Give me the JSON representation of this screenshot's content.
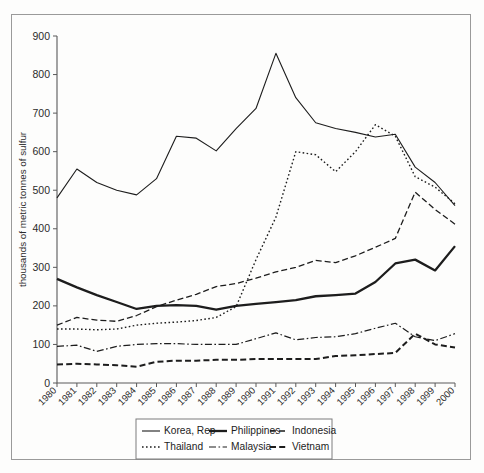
{
  "chart_data": {
    "type": "line",
    "title": "",
    "xlabel": "",
    "ylabel": "thousands of metric tonnes of sulfur",
    "xlim": [
      1980,
      2000
    ],
    "ylim": [
      0,
      900
    ],
    "yticks": [
      0,
      100,
      200,
      300,
      400,
      500,
      600,
      700,
      800,
      900
    ],
    "grid": false,
    "legend_position": "bottom",
    "x": [
      1980,
      1981,
      1982,
      1983,
      1984,
      1985,
      1986,
      1987,
      1988,
      1989,
      1990,
      1991,
      1992,
      1993,
      1994,
      1995,
      1996,
      1997,
      1998,
      1999,
      2000
    ],
    "categories": [
      "1980",
      "1981",
      "1982",
      "1983",
      "1984",
      "1985",
      "1986",
      "1987",
      "1988",
      "1989",
      "1990",
      "1991",
      "1992",
      "1993",
      "1994",
      "1995",
      "1996",
      "1997",
      "1998",
      "1999",
      "2000"
    ],
    "series": [
      {
        "name": "Korea, Rep",
        "style": "solid",
        "width": 1.1,
        "dash": "none",
        "values": [
          480,
          555,
          520,
          500,
          488,
          530,
          640,
          635,
          602,
          660,
          712,
          855,
          740,
          675,
          660,
          650,
          638,
          645,
          560,
          520,
          460
        ]
      },
      {
        "name": "Philippines",
        "style": "solid-thick",
        "width": 2.3,
        "dash": "none",
        "values": [
          270,
          248,
          228,
          210,
          192,
          200,
          202,
          200,
          190,
          200,
          205,
          210,
          215,
          225,
          228,
          232,
          262,
          310,
          320,
          292,
          355
        ]
      },
      {
        "name": "Indonesia",
        "style": "dashed",
        "width": 1.3,
        "dash": "6,3",
        "values": [
          150,
          170,
          163,
          160,
          175,
          198,
          215,
          230,
          250,
          258,
          272,
          288,
          300,
          318,
          312,
          330,
          352,
          375,
          495,
          450,
          412
        ]
      },
      {
        "name": "Thailand",
        "style": "dotted",
        "width": 1.4,
        "dash": "1.6,2.4",
        "values": [
          140,
          140,
          138,
          140,
          150,
          155,
          158,
          162,
          170,
          198,
          320,
          430,
          600,
          592,
          548,
          600,
          670,
          640,
          535,
          508,
          465
        ]
      },
      {
        "name": "Malaysia",
        "style": "dash-dot",
        "width": 1.2,
        "dash": "7,2.5,1.6,2.5",
        "values": [
          95,
          98,
          82,
          95,
          100,
          102,
          102,
          100,
          100,
          100,
          115,
          130,
          112,
          118,
          120,
          128,
          142,
          155,
          120,
          110,
          128
        ]
      },
      {
        "name": "Vietnam",
        "style": "thick-dash",
        "width": 2.0,
        "dash": "6,3.2",
        "values": [
          48,
          50,
          48,
          46,
          42,
          55,
          58,
          58,
          60,
          60,
          62,
          62,
          62,
          62,
          70,
          72,
          75,
          78,
          128,
          100,
          92
        ]
      }
    ]
  },
  "legend": {
    "items": [
      {
        "label": "Korea, Rep",
        "style": "solid"
      },
      {
        "label": "Philippines",
        "style": "solid-thick"
      },
      {
        "label": "Indonesia",
        "style": "dashed"
      },
      {
        "label": "Thailand",
        "style": "dotted"
      },
      {
        "label": "Malaysia",
        "style": "dash-dot"
      },
      {
        "label": "Vietnam",
        "style": "thick-dash"
      }
    ]
  },
  "colors": {
    "line": "#1d1d1d",
    "axis": "#5a5a5a",
    "frame": "#9a9a9a",
    "background": "#fdfdfc"
  }
}
